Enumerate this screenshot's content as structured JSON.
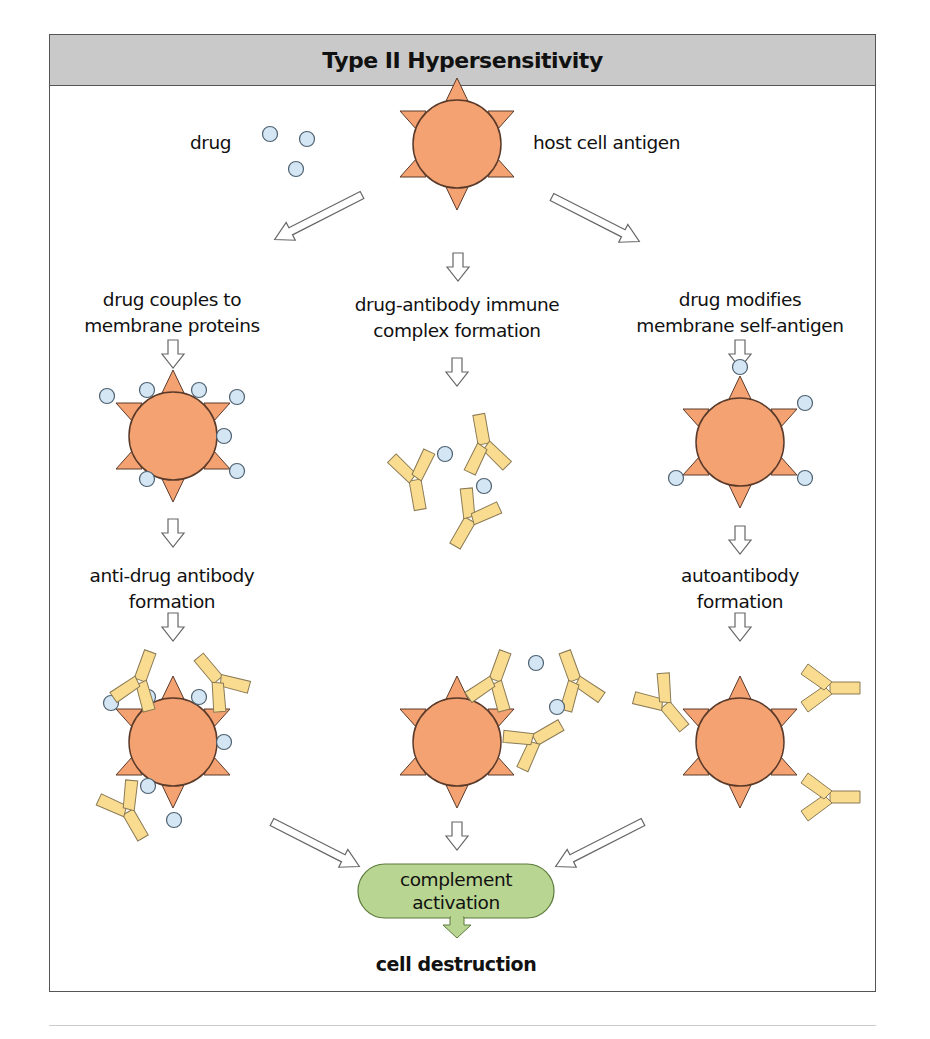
{
  "figure": {
    "title": "Type II Hypersensitivity",
    "colors": {
      "header_bg": "#c9c9c9",
      "cell_fill": "#f4a271",
      "cell_stroke": "#5a3a2a",
      "drug_fill": "#d4e6f3",
      "drug_stroke": "#4d6070",
      "antibody_fill": "#f9dc8f",
      "antibody_stroke": "#8a7a55",
      "complement_fill": "#b9d592",
      "complement_stroke": "#5c7a3c"
    },
    "top": {
      "drug_label": "drug",
      "host_label": "host cell antigen"
    },
    "left_path": {
      "step1": [
        "drug couples to",
        "membrane proteins"
      ],
      "step2": [
        "anti-drug antibody",
        "formation"
      ]
    },
    "center_path": {
      "step1": [
        "drug-antibody immune",
        "complex formation"
      ]
    },
    "right_path": {
      "step1": [
        "drug modifies",
        "membrane self-antigen"
      ],
      "step2": [
        "autoantibody",
        "formation"
      ]
    },
    "outcome": {
      "complement": [
        "complement",
        "activation"
      ],
      "result": "cell destruction"
    },
    "legend_icons": [
      "host-cell-icon",
      "drug-molecule-icon",
      "antibody-icon",
      "flow-arrow-icon"
    ]
  }
}
